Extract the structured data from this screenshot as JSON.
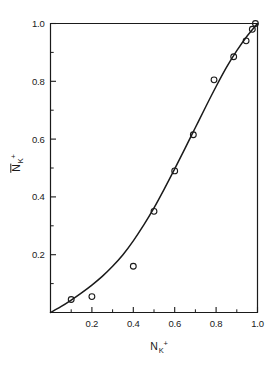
{
  "chart_data": {
    "type": "scatter",
    "title": "",
    "subtitle": "",
    "xlabel": "N_K+",
    "ylabel": "N̄_K+",
    "xlabel_parts": {
      "base": "N",
      "sub": "K",
      "sup": "+",
      "overbar": false
    },
    "ylabel_parts": {
      "base": "N",
      "sub": "K",
      "sup": "+",
      "overbar": true
    },
    "xlim": [
      0,
      1.0
    ],
    "ylim": [
      0,
      1.0
    ],
    "grid": false,
    "legend": "none",
    "x_major_ticks": [
      0.2,
      0.4,
      0.6,
      0.8,
      1.0
    ],
    "x_tick_labels": [
      "0.2",
      "0.4",
      "0.6",
      "0.8",
      "1.0"
    ],
    "x_minor_ticks": [
      0.1,
      0.3,
      0.5,
      0.7,
      0.9
    ],
    "y_major_ticks": [
      0.2,
      0.4,
      0.6,
      0.8,
      1.0
    ],
    "y_tick_labels": [
      "0.2",
      "0.4",
      "0.6",
      "0.8",
      "1.0"
    ],
    "y_minor_ticks": [
      0.1,
      0.3,
      0.5,
      0.7,
      0.9
    ],
    "tick_direction": "in",
    "marker": "open-circle",
    "marker_color": "#1a1a1a",
    "line_color": "#1a1a1a",
    "axis_color": "#1a1a1a",
    "series": [
      {
        "name": "measured",
        "type": "scatter",
        "x": [
          0.1,
          0.2,
          0.4,
          0.5,
          0.6,
          0.69,
          0.79,
          0.885,
          0.945,
          0.975,
          0.99
        ],
        "y": [
          0.045,
          0.055,
          0.16,
          0.35,
          0.49,
          0.615,
          0.805,
          0.885,
          0.94,
          0.98,
          1.0
        ]
      },
      {
        "name": "fitted-curve",
        "type": "line",
        "x": [
          0.0,
          0.05,
          0.1,
          0.15,
          0.2,
          0.25,
          0.3,
          0.35,
          0.4,
          0.45,
          0.5,
          0.55,
          0.6,
          0.65,
          0.7,
          0.75,
          0.8,
          0.85,
          0.9,
          0.95,
          1.0
        ],
        "y": [
          0.0,
          0.02,
          0.043,
          0.068,
          0.095,
          0.125,
          0.16,
          0.2,
          0.248,
          0.302,
          0.362,
          0.428,
          0.497,
          0.568,
          0.64,
          0.712,
          0.782,
          0.848,
          0.906,
          0.957,
          1.0
        ]
      }
    ]
  }
}
